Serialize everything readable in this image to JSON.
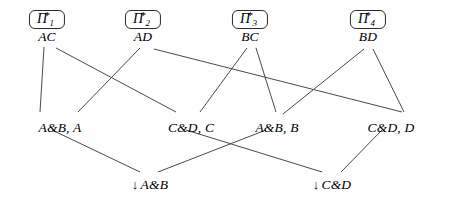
{
  "diagram": {
    "type": "lattice-hasse-diagram",
    "stroke_color": "#4a4a4a",
    "text_color": "#1a1a1a",
    "background": "#fefefe",
    "top_nodes": [
      {
        "id": "pi1",
        "pi_glyph": "Π",
        "subscript": "1",
        "superscript": "*",
        "label": "AC",
        "x": 47,
        "y": 10
      },
      {
        "id": "pi2",
        "pi_glyph": "Π",
        "subscript": "2",
        "superscript": "*",
        "label": "AD",
        "x": 143,
        "y": 10
      },
      {
        "id": "pi3",
        "pi_glyph": "Π",
        "subscript": "3",
        "superscript": "*",
        "label": "BC",
        "x": 250,
        "y": 10
      },
      {
        "id": "pi4",
        "pi_glyph": "Π",
        "subscript": "4",
        "superscript": "*",
        "label": "BD",
        "x": 368,
        "y": 10
      }
    ],
    "middle_nodes": [
      {
        "id": "ab_a",
        "label": "A&B, A",
        "x": 60,
        "y": 120
      },
      {
        "id": "cd_c",
        "label": "C&D, C",
        "x": 191,
        "y": 120
      },
      {
        "id": "ab_b",
        "label": "A&B, B",
        "x": 277,
        "y": 120
      },
      {
        "id": "cd_d",
        "label": "C&D, D",
        "x": 391,
        "y": 120
      }
    ],
    "bottom_nodes": [
      {
        "id": "down_ab",
        "arrow": "↓",
        "label": "A&B",
        "x": 150,
        "y": 177
      },
      {
        "id": "down_cd",
        "arrow": "↓",
        "label": "C&D",
        "x": 332,
        "y": 177
      }
    ],
    "edges": [
      {
        "from": "pi1",
        "to": "ab_a",
        "x1": 44,
        "y1": 47,
        "x2": 40,
        "y2": 112
      },
      {
        "from": "pi1",
        "to": "cd_c",
        "x1": 56,
        "y1": 48,
        "x2": 176,
        "y2": 112
      },
      {
        "from": "pi2",
        "to": "ab_a",
        "x1": 140,
        "y1": 48,
        "x2": 78,
        "y2": 112
      },
      {
        "from": "pi2",
        "to": "cd_d",
        "x1": 154,
        "y1": 49,
        "x2": 402,
        "y2": 112
      },
      {
        "from": "pi3",
        "to": "cd_c",
        "x1": 247,
        "y1": 48,
        "x2": 200,
        "y2": 112
      },
      {
        "from": "pi3",
        "to": "ab_b",
        "x1": 256,
        "y1": 48,
        "x2": 276,
        "y2": 112
      },
      {
        "from": "pi4",
        "to": "ab_b",
        "x1": 364,
        "y1": 49,
        "x2": 283,
        "y2": 114
      },
      {
        "from": "pi4",
        "to": "cd_d",
        "x1": 373,
        "y1": 49,
        "x2": 404,
        "y2": 112
      },
      {
        "from": "ab_a",
        "to": "down_ab",
        "x1": 52,
        "y1": 130,
        "x2": 140,
        "y2": 172
      },
      {
        "from": "cd_c",
        "to": "down_cd",
        "x1": 186,
        "y1": 130,
        "x2": 322,
        "y2": 172
      },
      {
        "from": "ab_b",
        "to": "down_ab",
        "x1": 266,
        "y1": 130,
        "x2": 158,
        "y2": 172
      },
      {
        "from": "cd_d",
        "to": "down_cd",
        "x1": 382,
        "y1": 130,
        "x2": 341,
        "y2": 172
      }
    ]
  }
}
